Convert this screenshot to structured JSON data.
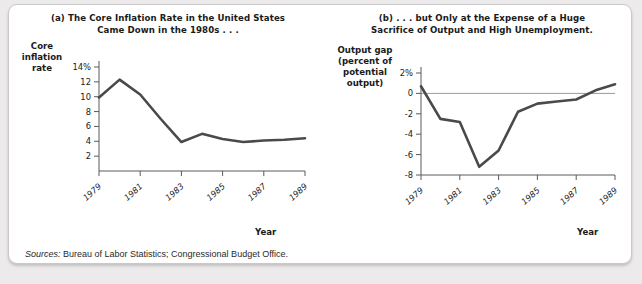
{
  "figure": {
    "sources_label": "Sources:",
    "sources_text": " Bureau of Labor Statistics; Congressional Budget Office."
  },
  "panel_a": {
    "title": "(a) The Core Inflation Rate in the United States Came Down in the 1980s . . .",
    "title_line1": "(a) The Core Inflation Rate in the United States",
    "title_line2": "Came Down in the 1980s . . .",
    "y_axis_title": "Core inflation rate",
    "x_axis_title": "Year"
  },
  "panel_b": {
    "title": "(b) . . . but Only at the Expense of a Huge Sacrifice of Output and High Unemployment.",
    "title_line1": "(b) . . . but Only at the Expense of a Huge",
    "title_line2": "Sacrifice of Output and High Unemployment.",
    "y_axis_title": "Output gap (percent of potential output)",
    "x_axis_title": "Year"
  },
  "chart_data": [
    {
      "type": "line",
      "title": "(a) The Core Inflation Rate in the United States Came Down in the 1980s . . .",
      "xlabel": "Year",
      "ylabel": "Core inflation rate",
      "x": [
        1979,
        1980,
        1981,
        1982,
        1983,
        1984,
        1985,
        1986,
        1987,
        1988,
        1989
      ],
      "values": [
        9.9,
        12.3,
        10.3,
        7.0,
        3.9,
        5.0,
        4.3,
        3.9,
        4.1,
        4.2,
        4.4
      ],
      "ylim": [
        0,
        14
      ],
      "xlim": [
        1979,
        1989
      ],
      "ytick_labels": [
        "14%",
        "12",
        "10",
        "8",
        "6",
        "4",
        "2"
      ],
      "yticks": [
        14,
        12,
        10,
        8,
        6,
        4,
        2
      ],
      "xtick_labels": [
        "1979",
        "1981",
        "1983",
        "1985",
        "1987",
        "1989"
      ],
      "xticks": [
        1979,
        1981,
        1983,
        1985,
        1987,
        1989
      ],
      "grid": false,
      "legend": "none",
      "line_color": "#4a4a4a"
    },
    {
      "type": "line",
      "title": "(b) . . . but Only at the Expense of a Huge Sacrifice of Output and High Unemployment.",
      "xlabel": "Year",
      "ylabel": "Output gap (percent of potential output)",
      "x": [
        1979,
        1980,
        1981,
        1982,
        1983,
        1984,
        1985,
        1986,
        1987,
        1988,
        1989
      ],
      "values": [
        0.7,
        -2.5,
        -2.8,
        -7.2,
        -5.6,
        -1.8,
        -1.0,
        -0.8,
        -0.6,
        0.3,
        0.9
      ],
      "ylim": [
        -8,
        2
      ],
      "xlim": [
        1979,
        1989
      ],
      "ytick_labels": [
        "2%",
        "0",
        "-2",
        "-4",
        "-6",
        "-8"
      ],
      "yticks": [
        2,
        0,
        -2,
        -4,
        -6,
        -8
      ],
      "xtick_labels": [
        "1979",
        "1981",
        "1983",
        "1985",
        "1987",
        "1989"
      ],
      "xticks": [
        1979,
        1981,
        1983,
        1985,
        1987,
        1989
      ],
      "grid": false,
      "legend": "none",
      "zero_line": true,
      "line_color": "#4a4a4a"
    }
  ]
}
